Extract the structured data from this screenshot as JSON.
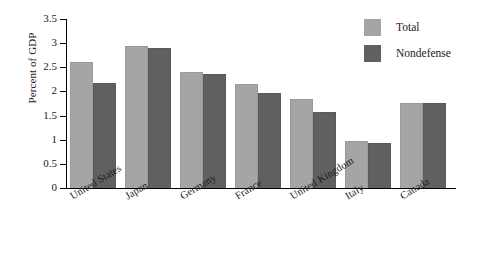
{
  "chart_data": {
    "type": "bar",
    "title": "",
    "xlabel": "",
    "ylabel": "Percent of GDP",
    "ylim": [
      0,
      3.5
    ],
    "yticks": [
      "0",
      "0.5",
      "1",
      "1.5",
      "2",
      "2.5",
      "3",
      "3.5"
    ],
    "ytick_values": [
      0,
      0.5,
      1,
      1.5,
      2,
      2.5,
      3,
      3.5
    ],
    "grid": false,
    "legend_position": "top-right",
    "categories": [
      "United States",
      "Japan",
      "Germany",
      "France",
      "United Kingdom",
      "Italy",
      "Canada"
    ],
    "series": [
      {
        "name": "Total",
        "color": "#a5a5a5",
        "values": [
          2.61,
          2.94,
          2.4,
          2.15,
          1.84,
          0.98,
          1.77
        ]
      },
      {
        "name": "Nondefense",
        "color": "#606060",
        "values": [
          2.17,
          2.9,
          2.36,
          1.97,
          1.57,
          0.94,
          1.77
        ]
      }
    ]
  },
  "legend": {
    "items": [
      {
        "label": "Total",
        "swatch": "total"
      },
      {
        "label": "Nondefense",
        "swatch": "nondefense"
      }
    ]
  }
}
